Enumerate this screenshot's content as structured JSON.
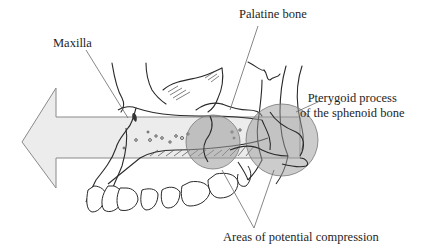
{
  "figure": {
    "type": "anatomical-illustration"
  },
  "labels": {
    "maxilla": "Maxilla",
    "palatine_bone": "Palatine bone",
    "pterygoid_line1": "Pterygoid process",
    "pterygoid_line2": "of the sphenoid bone",
    "compression": "Areas of potential compression"
  },
  "arrow": {
    "direction": "left",
    "fill": "#e8e8e8",
    "stroke": "#8a8a8a"
  },
  "compression_zones": [
    {
      "name": "maxilla-palatine-junction",
      "fill": "#9a9a9a"
    },
    {
      "name": "palatine-pterygoid-junction",
      "fill": "#9a9a9a"
    }
  ],
  "colors": {
    "line_art": "#2a2a2a",
    "leader_lines": "#6a6a6a",
    "background": "#ffffff"
  }
}
